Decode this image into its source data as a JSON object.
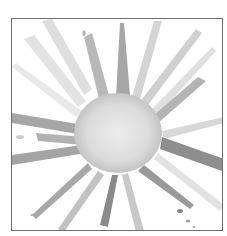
{
  "artwork": {
    "subject": "watercolor-starburst",
    "colors": {
      "frame": "#6e6e6e",
      "background": "#ffffff",
      "ink_dark": "#7a7a7a",
      "ink_mid": "#a8a8a8",
      "ink_light": "#d6d6d6",
      "center": "#e2e2e2"
    }
  }
}
